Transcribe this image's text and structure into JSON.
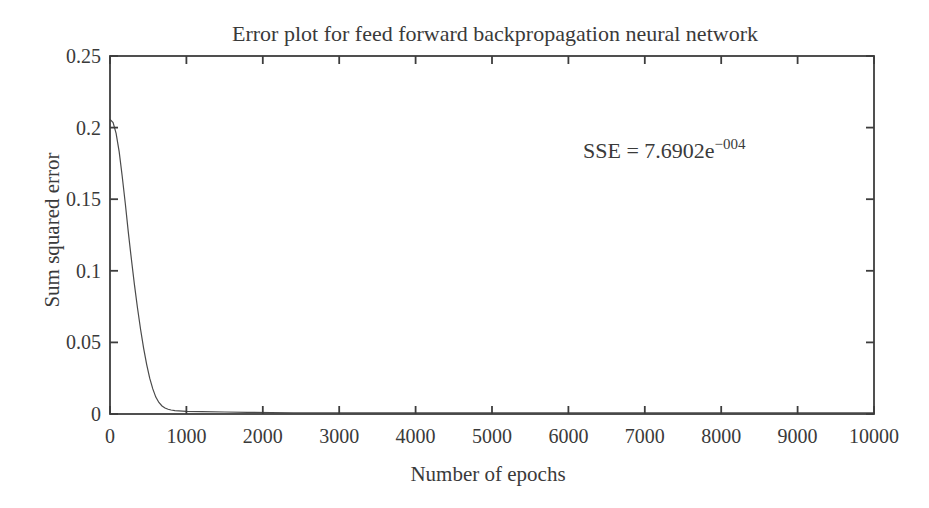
{
  "figure": {
    "annotation": {
      "prefix": "SSE = 7.6902e",
      "exponent": "−004"
    }
  },
  "chart_data": {
    "type": "line",
    "title": "Error plot for feed forward backpropagation neural network",
    "xlabel": "Number of epochs",
    "ylabel": "Sum squared error",
    "xlim": [
      0,
      10000
    ],
    "ylim": [
      0,
      0.25
    ],
    "xticks": [
      0,
      1000,
      2000,
      3000,
      4000,
      5000,
      6000,
      7000,
      8000,
      9000,
      10000
    ],
    "xtick_labels": [
      "0",
      "1000",
      "2000",
      "3000",
      "4000",
      "5000",
      "6000",
      "7000",
      "8000",
      "9000",
      "10000"
    ],
    "yticks": [
      0,
      0.05,
      0.1,
      0.15,
      0.2,
      0.25
    ],
    "ytick_labels": [
      "0",
      "0.05",
      "0.1",
      "0.15",
      "0.2",
      "0.25"
    ],
    "grid": false,
    "legend": "none",
    "box": true,
    "tick_direction": "in",
    "annotation": {
      "text": "SSE = 7.6902e−004",
      "value": 0.00076902,
      "x_data": 7500,
      "y_data": 0.185
    },
    "series": [
      {
        "name": "Sum squared error",
        "x": [
          0,
          40,
          80,
          120,
          160,
          200,
          240,
          280,
          320,
          360,
          400,
          440,
          480,
          520,
          560,
          600,
          640,
          680,
          720,
          760,
          800,
          850,
          900,
          1000,
          1200,
          1500,
          1800,
          2100,
          2400,
          3000,
          4000,
          5000,
          6000,
          7000,
          8000,
          9000,
          10000
        ],
        "y": [
          0.2057,
          0.2035,
          0.196,
          0.183,
          0.166,
          0.147,
          0.127,
          0.108,
          0.0905,
          0.074,
          0.059,
          0.046,
          0.0345,
          0.025,
          0.0175,
          0.0118,
          0.008,
          0.0056,
          0.0042,
          0.0033,
          0.0028,
          0.0024,
          0.0022,
          0.0019,
          0.0016,
          0.0014,
          0.0012,
          0.001,
          0.0008,
          0.00077,
          0.00077,
          0.00077,
          0.00077,
          0.00077,
          0.00077,
          0.00077,
          0.00076902
        ]
      }
    ],
    "colors": {
      "curve": "#4a4a4a",
      "axis": "#3d3d3d",
      "text": "#3a3a3a",
      "background": "#ffffff"
    }
  }
}
